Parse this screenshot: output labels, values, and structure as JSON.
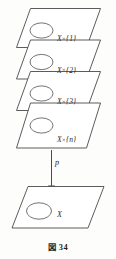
{
  "figure": {
    "caption_label": "図",
    "caption_number": "34",
    "caption_full": "図 34",
    "diagram_type": "fiber-bundle-covering-space",
    "ink_color": "#4a4a4a",
    "background_color": "#fdfdfc"
  },
  "total_space_sheets": [
    {
      "id": "sheet-1",
      "label_base": "X",
      "label_times": "×",
      "label_fiber": "{1}",
      "label_full": "X×{1}"
    },
    {
      "id": "sheet-2",
      "label_base": "X",
      "label_times": "×",
      "label_fiber": "{2}",
      "label_full": "X×{2}"
    },
    {
      "id": "sheet-3",
      "label_base": "X",
      "label_times": "×",
      "label_fiber": "{3}",
      "label_full": "X×{3}"
    },
    {
      "id": "sheet-n",
      "label_base": "X",
      "label_times": "×",
      "label_fiber": "{n}",
      "label_full": "X×{n}"
    }
  ],
  "projection": {
    "map_label": "p",
    "direction": "downward"
  },
  "base_space": {
    "id": "base-plane",
    "label": "X"
  }
}
